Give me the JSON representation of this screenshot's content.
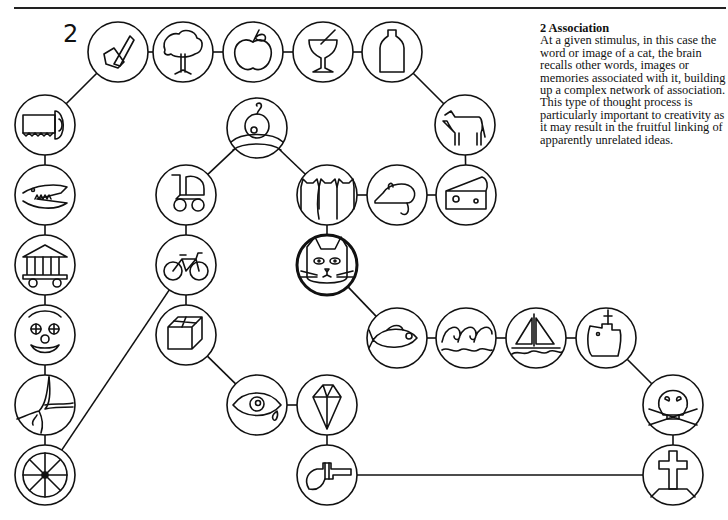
{
  "figure": {
    "number": "2",
    "caption_title": "2  Association",
    "caption_body": "At a given stimulus, in this case the word or image of a cat, the brain recalls other words, images or memories associated with it, building up a complex network of association. This type of thought process is particularly important to creativity as it may result in the fruitful linking of apparently unrelated ideas."
  },
  "nodes": [
    {
      "id": "axe",
      "label": "axe-icon",
      "x": 118,
      "y": 52
    },
    {
      "id": "tree",
      "label": "tree-icon",
      "x": 183,
      "y": 52
    },
    {
      "id": "apple",
      "label": "apple-icon",
      "x": 253,
      "y": 52
    },
    {
      "id": "glass",
      "label": "glass-icon",
      "x": 323,
      "y": 52
    },
    {
      "id": "bottle",
      "label": "milk-bottle-icon",
      "x": 392,
      "y": 52
    },
    {
      "id": "cow",
      "label": "cow-icon",
      "x": 465,
      "y": 125
    },
    {
      "id": "saw",
      "label": "saw-icon",
      "x": 45,
      "y": 125
    },
    {
      "id": "crocodile",
      "label": "crocodile-icon",
      "x": 45,
      "y": 195
    },
    {
      "id": "temple",
      "label": "temple-icon",
      "x": 45,
      "y": 265
    },
    {
      "id": "clown",
      "label": "clown-icon",
      "x": 45,
      "y": 335
    },
    {
      "id": "crack",
      "label": "crack-icon",
      "x": 45,
      "y": 405
    },
    {
      "id": "wheel",
      "label": "wheel-icon",
      "x": 45,
      "y": 475
    },
    {
      "id": "baby",
      "label": "baby-icon",
      "x": 257,
      "y": 128
    },
    {
      "id": "pram",
      "label": "pram-icon",
      "x": 186,
      "y": 195
    },
    {
      "id": "bicycle",
      "label": "bicycle-icon",
      "x": 186,
      "y": 265
    },
    {
      "id": "box",
      "label": "box-icon",
      "x": 186,
      "y": 335
    },
    {
      "id": "cats",
      "label": "three-cats-icon",
      "x": 327,
      "y": 195
    },
    {
      "id": "mouse",
      "label": "mouse-icon",
      "x": 397,
      "y": 195
    },
    {
      "id": "cheese",
      "label": "cheese-icon",
      "x": 466,
      "y": 195
    },
    {
      "id": "cat",
      "label": "cat-icon",
      "x": 327,
      "y": 265,
      "center": true
    },
    {
      "id": "fish",
      "label": "fish-icon",
      "x": 397,
      "y": 338
    },
    {
      "id": "waves",
      "label": "waves-icon",
      "x": 466,
      "y": 338
    },
    {
      "id": "boat",
      "label": "sailboat-icon",
      "x": 536,
      "y": 338
    },
    {
      "id": "ship",
      "label": "ship-icon",
      "x": 606,
      "y": 338
    },
    {
      "id": "skull",
      "label": "skull-crossbones-icon",
      "x": 673,
      "y": 405
    },
    {
      "id": "grave",
      "label": "gravestone-icon",
      "x": 673,
      "y": 475
    },
    {
      "id": "eye",
      "label": "crying-eye-icon",
      "x": 257,
      "y": 405
    },
    {
      "id": "diamond",
      "label": "diamond-icon",
      "x": 327,
      "y": 405
    },
    {
      "id": "gun",
      "label": "revolver-icon",
      "x": 327,
      "y": 475
    }
  ],
  "edges": [
    [
      "axe",
      "tree"
    ],
    [
      "tree",
      "apple"
    ],
    [
      "apple",
      "glass"
    ],
    [
      "glass",
      "bottle"
    ],
    [
      "bottle",
      "cow"
    ],
    [
      "cow",
      "cheese"
    ],
    [
      "cheese",
      "mouse"
    ],
    [
      "mouse",
      "cats"
    ],
    [
      "cats",
      "cat"
    ],
    [
      "cats",
      "baby"
    ],
    [
      "baby",
      "pram"
    ],
    [
      "pram",
      "bicycle"
    ],
    [
      "bicycle",
      "box"
    ],
    [
      "bicycle",
      "wheel"
    ],
    [
      "box",
      "eye"
    ],
    [
      "eye",
      "diamond"
    ],
    [
      "diamond",
      "gun"
    ],
    [
      "gun",
      "grave"
    ],
    [
      "grave",
      "skull"
    ],
    [
      "skull",
      "ship"
    ],
    [
      "ship",
      "boat"
    ],
    [
      "boat",
      "waves"
    ],
    [
      "waves",
      "fish"
    ],
    [
      "fish",
      "cat"
    ],
    [
      "axe",
      "saw"
    ],
    [
      "saw",
      "crocodile"
    ],
    [
      "crocodile",
      "temple"
    ],
    [
      "temple",
      "clown"
    ],
    [
      "clown",
      "crack"
    ],
    [
      "crack",
      "wheel"
    ]
  ]
}
